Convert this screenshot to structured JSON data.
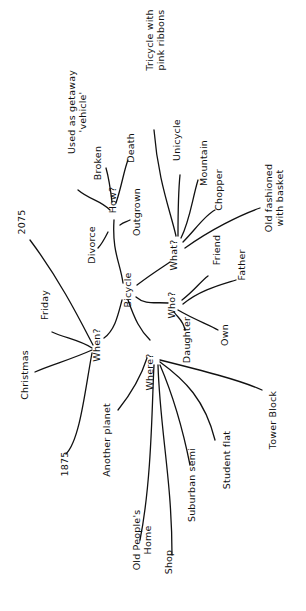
{
  "mindmap": {
    "center": {
      "id": "bicycle",
      "label": "Bicycle",
      "x": 131,
      "y": 290
    },
    "branches": [
      {
        "id": "how",
        "label": "How?",
        "x": 116,
        "y": 200,
        "edge": "M123,283 C120,262 112,252 114,220",
        "children": [
          {
            "id": "used-as-getaway",
            "label": "Used as getaway 'vehicle'",
            "x": 75,
            "y": 112,
            "edge": "M110,210 C100,200 90,200 78,190"
          },
          {
            "id": "broken",
            "label": "Broken",
            "x": 101,
            "y": 163,
            "edge": "M112,202 C110,185 108,175 106,168"
          },
          {
            "id": "death",
            "label": "Death",
            "x": 134,
            "y": 148,
            "edge": "M116,203 C122,185 124,170 128,160"
          },
          {
            "id": "outgrown",
            "label": "Outgrown",
            "x": 140,
            "y": 212,
            "edge": "M120,225 C124,222 126,222 130,220"
          },
          {
            "id": "divorce",
            "label": "Divorce",
            "x": 95,
            "y": 245,
            "edge": "M108,232 C104,240 102,244 98,248"
          }
        ]
      },
      {
        "id": "what",
        "label": "What?",
        "x": 177,
        "y": 255,
        "edge": "M137,285 C150,275 158,270 170,262",
        "children": [
          {
            "id": "tricycle",
            "label": "Tricycle with pink ribbons",
            "x": 153,
            "y": 40,
            "edge": "M176,236 C170,210 158,180 154,130"
          },
          {
            "id": "unicycle",
            "label": "Unicycle",
            "x": 180,
            "y": 140,
            "edge": "M178,236 C178,215 178,195 180,175"
          },
          {
            "id": "mountain",
            "label": "Mountain",
            "x": 207,
            "y": 163,
            "edge": "M181,238 C190,220 192,200 198,180"
          },
          {
            "id": "chopper",
            "label": "Chopper",
            "x": 222,
            "y": 190,
            "edge": "M183,242 C195,230 205,215 215,210"
          },
          {
            "id": "old-fashioned",
            "label": "Old fashioned with basket",
            "x": 272,
            "y": 198,
            "edge": "M185,248 C210,230 240,215 260,208"
          }
        ]
      },
      {
        "id": "who",
        "label": "Who?",
        "x": 175,
        "y": 305,
        "edge": "M136,297 C145,305 155,302 168,303",
        "children": [
          {
            "id": "friend",
            "label": "Friend",
            "x": 220,
            "y": 250,
            "edge": "M182,300 C195,290 200,282 208,276"
          },
          {
            "id": "father",
            "label": "Father",
            "x": 245,
            "y": 265,
            "edge": "M183,304 C200,290 220,285 236,280"
          },
          {
            "id": "daughter",
            "label": "Daughter",
            "x": 190,
            "y": 340,
            "edge": "M174,312 C178,318 183,320 185,330"
          },
          {
            "id": "own",
            "label": "Own",
            "x": 228,
            "y": 335,
            "edge": "M178,310 C195,320 210,325 218,330"
          }
        ]
      },
      {
        "id": "when",
        "label": "When?",
        "x": 100,
        "y": 345,
        "edge": "M122,300 C118,315 115,330 104,338",
        "children": [
          {
            "id": "year-2075",
            "label": "2075",
            "x": 25,
            "y": 222,
            "edge": "M93,345 C80,320 60,280 30,240"
          },
          {
            "id": "friday",
            "label": "Friday",
            "x": 48,
            "y": 305,
            "edge": "M92,348 C80,340 65,338 52,332"
          },
          {
            "id": "christmas",
            "label": "Christmas",
            "x": 28,
            "y": 375,
            "edge": "M92,350 C70,360 50,365 35,372"
          },
          {
            "id": "year-1875",
            "label": "1875",
            "x": 68,
            "y": 464,
            "edge": "M92,353 C85,390 80,440 66,454"
          }
        ]
      },
      {
        "id": "where",
        "label": "Where?",
        "x": 153,
        "y": 372,
        "edge": "M128,300 C135,320 140,330 150,340",
        "children": [
          {
            "id": "another-planet",
            "label": "Another planet",
            "x": 110,
            "y": 440,
            "edge": "M147,358 C140,380 130,395 118,410"
          },
          {
            "id": "old-peoples-home",
            "label": "Old People's Home",
            "x": 140,
            "y": 540,
            "edge": "M154,365 C152,400 152,480 140,540"
          },
          {
            "id": "shop",
            "label": "Shop",
            "x": 172,
            "y": 562,
            "edge": "M158,365 C160,430 172,480 172,555"
          },
          {
            "id": "suburban-semi",
            "label": "Suburban semi",
            "x": 195,
            "y": 485,
            "edge": "M160,365 C175,400 185,440 190,465"
          },
          {
            "id": "student-flat",
            "label": "Student flat",
            "x": 230,
            "y": 460,
            "edge": "M160,362 C185,380 205,400 215,440"
          },
          {
            "id": "tower-block",
            "label": "Tower Block",
            "x": 276,
            "y": 420,
            "edge": "M160,360 C200,370 240,380 262,390"
          }
        ]
      }
    ]
  }
}
